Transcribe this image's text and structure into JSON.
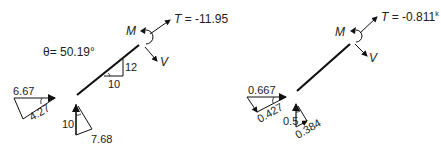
{
  "left_diagram": {
    "theta_label": "θ= 50.19°",
    "tension_label": "T = -11.95",
    "moment_label": "M",
    "shear_label": "V",
    "slope_rise": "12",
    "slope_run": "10",
    "horizontal_triangle": {
      "top": "6.67",
      "hyp": "4.27"
    },
    "vertical_triangle": {
      "side": "10",
      "hyp": "7.68"
    }
  },
  "right_diagram": {
    "tension_label": "T = -0.811",
    "tension_unit": "k",
    "moment_label": "M",
    "shear_label": "V",
    "horizontal_triangle": {
      "top": "0.667",
      "hyp": "0.427"
    },
    "vertical_triangle": {
      "side": "0.5",
      "hyp": "0.384"
    }
  },
  "colors": {
    "line": "#111111",
    "text": "#222222",
    "background": "#ffffff"
  }
}
